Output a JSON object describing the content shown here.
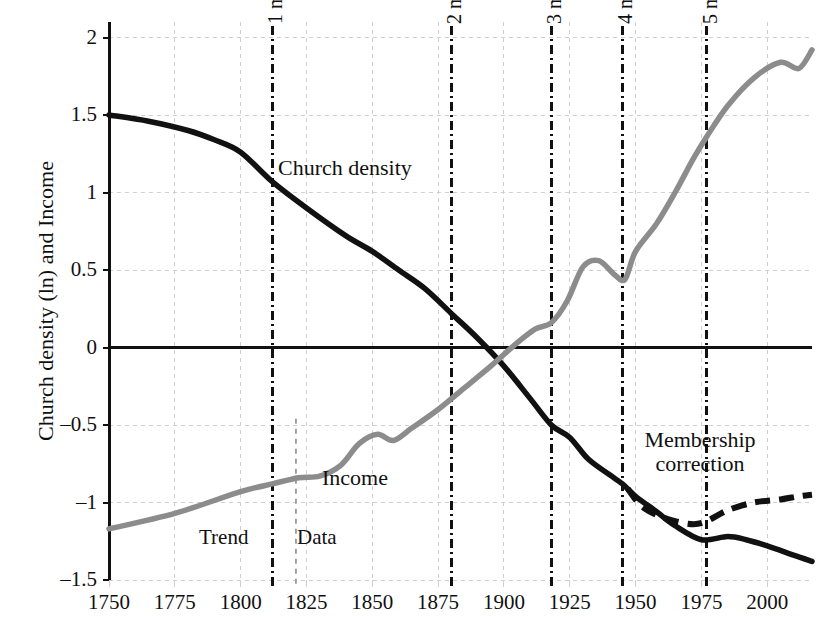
{
  "chart_data": {
    "type": "line",
    "title": "",
    "xlabel": "",
    "ylabel": "Church density (ln) and Income",
    "xlim": [
      1750,
      2017
    ],
    "ylim": [
      -1.5,
      2.1
    ],
    "grid": true,
    "legend_position": "inline-annotations",
    "xticks": [
      "1750",
      "1775",
      "1800",
      "1825",
      "1850",
      "1875",
      "1900",
      "1925",
      "1950",
      "1975",
      "2000"
    ],
    "xtick_values": [
      1750,
      1775,
      1800,
      1825,
      1850,
      1875,
      1900,
      1925,
      1950,
      1975,
      2000
    ],
    "yticks": [
      "2",
      "1.5",
      "1",
      "0.5",
      "0",
      "–0.5",
      "–1",
      "–1.5"
    ],
    "ytick_values": [
      2,
      1.5,
      1,
      0.5,
      0,
      -0.5,
      -1,
      -1.5
    ],
    "series": [
      {
        "name": "Church density",
        "color": "#111111",
        "style": "solid",
        "x": [
          1750,
          1765,
          1780,
          1790,
          1800,
          1812,
          1825,
          1840,
          1850,
          1860,
          1870,
          1880,
          1890,
          1900,
          1910,
          1918,
          1925,
          1932,
          1940,
          1945,
          1950,
          1958,
          1965,
          1975,
          1985,
          1992,
          2000,
          2010,
          2017
        ],
        "values": [
          1.5,
          1.46,
          1.4,
          1.34,
          1.26,
          1.07,
          0.9,
          0.72,
          0.62,
          0.5,
          0.38,
          0.22,
          0.06,
          -0.12,
          -0.33,
          -0.5,
          -0.58,
          -0.72,
          -0.82,
          -0.88,
          -0.96,
          -1.06,
          -1.15,
          -1.24,
          -1.22,
          -1.24,
          -1.28,
          -1.34,
          -1.38
        ]
      },
      {
        "name": "Income",
        "color": "#8c8c8c",
        "style": "solid",
        "x": [
          1750,
          1775,
          1800,
          1812,
          1822,
          1830,
          1838,
          1845,
          1852,
          1858,
          1865,
          1875,
          1885,
          1895,
          1905,
          1912,
          1918,
          1924,
          1930,
          1936,
          1942,
          1946,
          1950,
          1958,
          1965,
          1972,
          1977,
          1985,
          1995,
          2005,
          2012,
          2017
        ],
        "values": [
          -1.17,
          -1.07,
          -0.93,
          -0.88,
          -0.84,
          -0.83,
          -0.76,
          -0.62,
          -0.56,
          -0.6,
          -0.52,
          -0.4,
          -0.26,
          -0.12,
          0.03,
          0.12,
          0.16,
          0.3,
          0.52,
          0.56,
          0.47,
          0.44,
          0.62,
          0.8,
          1.0,
          1.22,
          1.36,
          1.56,
          1.74,
          1.84,
          1.8,
          1.92
        ]
      },
      {
        "name": "Membership correction",
        "color": "#111111",
        "style": "dashed",
        "x": [
          1947,
          1952,
          1958,
          1965,
          1972,
          1977,
          1985,
          1995,
          2005,
          2012,
          2017
        ],
        "values": [
          -0.91,
          -1.02,
          -1.08,
          -1.12,
          -1.14,
          -1.12,
          -1.05,
          -1.0,
          -0.98,
          -0.96,
          -0.95
        ]
      }
    ],
    "vertical_markers": [
      {
        "label": "1 mil",
        "x": 1812,
        "style": "dash-dot",
        "color": "#111111"
      },
      {
        "label": "2 mil",
        "x": 1880,
        "style": "dash-dot",
        "color": "#111111"
      },
      {
        "label": "3 mil",
        "x": 1918,
        "style": "dash-dot",
        "color": "#111111"
      },
      {
        "label": "4 mil",
        "x": 1945,
        "style": "dash-dot",
        "color": "#111111"
      },
      {
        "label": "5 mil",
        "x": 1977,
        "style": "dash-dot",
        "color": "#111111"
      }
    ],
    "split_marker": {
      "label": "",
      "x": 1821,
      "style": "dashed",
      "color": "#9a9a9a"
    },
    "annotations": [
      {
        "text": "Church density",
        "x": 1822,
        "y": 1.05
      },
      {
        "text": "Income",
        "x": 1838,
        "y": -0.9
      },
      {
        "text": "Membership",
        "x": 1966,
        "y": -0.62
      },
      {
        "text": "correction",
        "x": 1968,
        "y": -0.74
      },
      {
        "text": "Trend",
        "x": 1801,
        "y": -1.23
      },
      {
        "text": "Data",
        "x": 1828,
        "y": -1.23
      }
    ]
  },
  "axis": {
    "y_title": "Church density (ln) and Income",
    "yticks": [
      "2",
      "1.5",
      "1",
      "0.5",
      "0",
      "–0.5",
      "–1",
      "–1.5"
    ],
    "xticks": [
      "1750",
      "1775",
      "1800",
      "1825",
      "1850",
      "1875",
      "1900",
      "1925",
      "1950",
      "1975",
      "2000"
    ]
  },
  "markers": {
    "m1": "1 mil",
    "m2": "2 mil",
    "m3": "3 mil",
    "m4": "4 mil",
    "m5": "5 mil"
  },
  "labels": {
    "church_density": "Church density",
    "income": "Income",
    "membership_line1": "Membership",
    "membership_line2": "correction",
    "trend": "Trend",
    "data": "Data"
  },
  "colors": {
    "church_density": "#111111",
    "income": "#8c8c8c",
    "grid": "#cfcfcf",
    "axis": "#111111",
    "split": "#9a9a9a",
    "background": "#ffffff"
  }
}
